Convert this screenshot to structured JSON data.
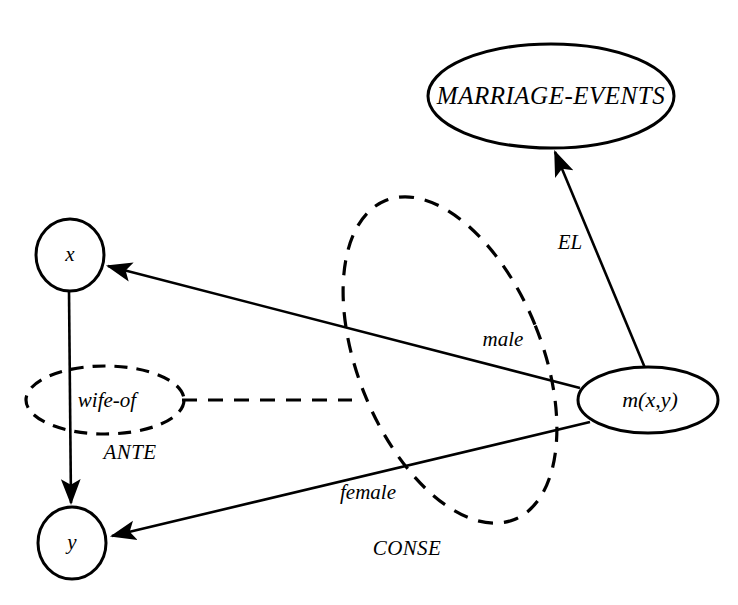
{
  "diagram": {
    "background_color": "#ffffff",
    "stroke_color": "#000000",
    "nodes": [
      {
        "id": "marriage_events",
        "label": "MARRIAGE-EVENTS",
        "shape": "ellipse",
        "style": "solid",
        "cx": 551,
        "cy": 96,
        "rx": 123,
        "ry": 52
      },
      {
        "id": "x",
        "label": "x",
        "shape": "circle",
        "style": "solid",
        "cx": 70,
        "cy": 255,
        "rx": 34,
        "ry": 36
      },
      {
        "id": "y",
        "label": "y",
        "shape": "circle",
        "style": "solid",
        "cx": 72,
        "cy": 543,
        "rx": 34,
        "ry": 36
      },
      {
        "id": "m_xy",
        "label": "m(x,y)",
        "shape": "ellipse",
        "style": "solid",
        "cx": 648,
        "cy": 400,
        "rx": 70,
        "ry": 33
      },
      {
        "id": "wife_of",
        "label": "wife-of",
        "shape": "ellipse",
        "style": "dashed",
        "cx": 105,
        "cy": 400,
        "rx": 79,
        "ry": 34
      }
    ],
    "regions": [
      {
        "id": "conse_region",
        "label": "CONSE",
        "style": "dashed",
        "cx": 450,
        "cy": 360,
        "rx": 92,
        "ry": 172,
        "rotation": -22,
        "label_x": 407,
        "label_y": 548
      },
      {
        "id": "ante_region",
        "label": "ANTE",
        "style": "dashed_ellipse_group",
        "label_x": 130,
        "label_y": 452
      }
    ],
    "edges": [
      {
        "id": "x_to_y",
        "label": "",
        "from": "x",
        "to": "y",
        "style": "solid",
        "arrow": true
      },
      {
        "id": "m_to_x",
        "label": "male",
        "from": "m_xy",
        "to": "x",
        "style": "solid",
        "arrow": true,
        "label_x": 503,
        "label_y": 339
      },
      {
        "id": "m_to_y",
        "label": "female",
        "from": "m_xy",
        "to": "y",
        "style": "solid",
        "arrow": true,
        "label_x": 368,
        "label_y": 492
      },
      {
        "id": "m_to_marriage_events",
        "label": "EL",
        "from": "m_xy",
        "to": "marriage_events",
        "style": "solid",
        "arrow": true,
        "label_x": 570,
        "label_y": 242
      },
      {
        "id": "wife_of_to_conse",
        "label": "",
        "from": "wife_of",
        "to": "conse_region",
        "style": "dashed",
        "arrow": false
      }
    ],
    "labels": {
      "marriage_events": "MARRIAGE-EVENTS",
      "x": "x",
      "y": "y",
      "m_xy": "m(x,y)",
      "wife_of": "wife-of",
      "ante": "ANTE",
      "conse": "CONSE",
      "el": "EL",
      "male": "male",
      "female": "female"
    }
  }
}
